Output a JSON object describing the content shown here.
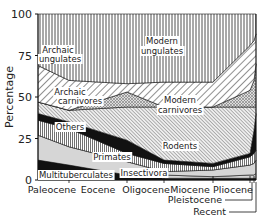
{
  "chart_data": {
    "type": "area",
    "title": "",
    "xlabel": "",
    "ylabel": "Percentage",
    "ylim": [
      0,
      100
    ],
    "yticks": [
      0,
      25,
      50,
      75,
      100
    ],
    "grid": false,
    "legend": "inline labels",
    "categories": [
      "Paleocene",
      "Eocene",
      "Oligocene",
      "Miocene",
      "Pliocene",
      "Pleistocene",
      "Recent"
    ],
    "x_positions": [
      38,
      69,
      127,
      164,
      213,
      250,
      254,
      256
    ],
    "boundaries_note": "cumulative upper boundaries (%) from bottom, at x_positions",
    "series": [
      {
        "name": "Multituberculates",
        "fill": "black",
        "upper": [
          12,
          9,
          3,
          1,
          1,
          1,
          1,
          1
        ]
      },
      {
        "name": "Insectivora",
        "fill": "lightgray",
        "upper": [
          12,
          9,
          3,
          3,
          2,
          3,
          3,
          4
        ]
      },
      {
        "name": "Primates",
        "fill": "lightgray",
        "upper": [
          27,
          20,
          11,
          5,
          6,
          9,
          10,
          12
        ]
      },
      {
        "name": "Others",
        "fill": "vertical-hatch",
        "upper": [
          36,
          31,
          16,
          10,
          8,
          14,
          16,
          18
        ]
      },
      {
        "name": "Rodents",
        "fill": "black",
        "upper": [
          40,
          35,
          24,
          12,
          10,
          16,
          30,
          40
        ]
      },
      {
        "name": "Archaic carnivores",
        "fill": "diagonal-hatch-dense",
        "upper": [
          47,
          42,
          44,
          44,
          44,
          44,
          44,
          44
        ]
      },
      {
        "name": "Modern carnivores",
        "fill": "cross-hatch",
        "upper": [
          47,
          42,
          53,
          42,
          33,
          54,
          60,
          70
        ]
      },
      {
        "name": "Archaic ungulates",
        "fill": "diagonal-hatch",
        "upper": [
          69,
          60,
          58,
          59,
          59,
          81,
          84,
          88
        ]
      },
      {
        "name": "Modern ungulates",
        "fill": "vertical-lines",
        "upper": [
          100,
          100,
          100,
          100,
          100,
          100,
          100,
          100
        ]
      }
    ],
    "labels": [
      {
        "text": "Modern",
        "x": 162,
        "y": 44
      },
      {
        "text": "ungulates",
        "x": 162,
        "y": 54
      },
      {
        "text": "Archaic",
        "x": 58,
        "y": 53
      },
      {
        "text": "ungulates",
        "x": 60,
        "y": 62
      },
      {
        "text": "Archaic",
        "x": 70,
        "y": 95
      },
      {
        "text": "carnivores",
        "x": 80,
        "y": 104
      },
      {
        "text": "Modern",
        "x": 180,
        "y": 103
      },
      {
        "text": "carnivores",
        "x": 180,
        "y": 113
      },
      {
        "text": "Others",
        "x": 70,
        "y": 130
      },
      {
        "text": "Rodents",
        "x": 180,
        "y": 149
      },
      {
        "text": "Primates",
        "x": 112,
        "y": 160
      },
      {
        "text": "Insectivora",
        "x": 144,
        "y": 176
      },
      {
        "text": "Multituberculates",
        "x": 76,
        "y": 178
      }
    ],
    "axis_labels": {
      "ytick_labels": [
        "0",
        "25",
        "50",
        "75",
        "100"
      ],
      "x_epochs": [
        {
          "text": "Paleocene",
          "x": 52
        },
        {
          "text": "Eocene",
          "x": 98
        },
        {
          "text": "Oligocene",
          "x": 146
        },
        {
          "text": "Miocene",
          "x": 190
        },
        {
          "text": "Pliocene",
          "x": 233
        }
      ],
      "callouts": [
        {
          "text": "Pleistocene",
          "x": 222,
          "y": 203
        },
        {
          "text": "Recent",
          "x": 226,
          "y": 215
        }
      ]
    }
  }
}
